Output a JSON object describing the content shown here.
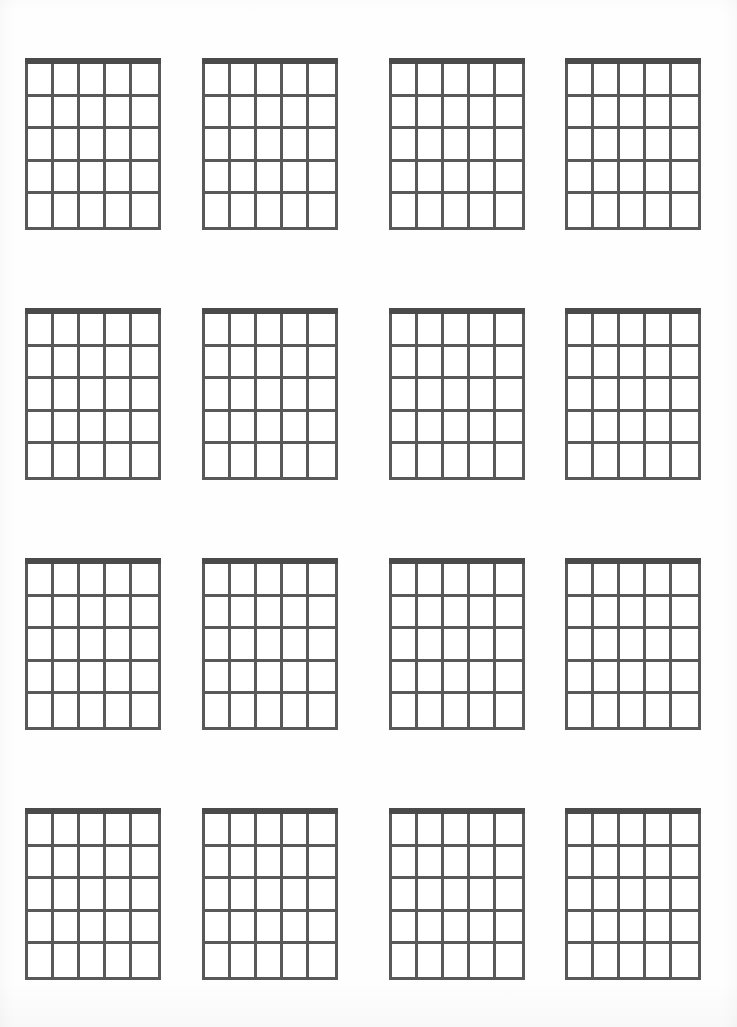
{
  "document": {
    "title": "Blank Guitar Chord Chart Sheet",
    "type": "blank-chord-diagram-worksheet",
    "background_color": "#ffffff",
    "page_width": 737,
    "page_height": 1027
  },
  "diagram_style": {
    "nut_color": "#4a4a4a",
    "grid_line_color": "#595959",
    "cell_fill_color": "#ffffff",
    "nut_thickness_px": 7,
    "grid_line_thickness_px": 3
  },
  "layout": {
    "rows": 4,
    "columns": 4,
    "total_diagrams": 16,
    "diagram_width_px": 136,
    "diagram_height_px": 172,
    "column_left_offsets_px": [
      25,
      202,
      389,
      565
    ],
    "row_top_offsets_px": [
      58,
      308,
      558,
      808
    ]
  },
  "chord_diagram_template": {
    "strings": 6,
    "string_columns": 5,
    "frets": 5,
    "has_nut": true,
    "labels": [],
    "fingering_dots": [],
    "open_string_markers": [],
    "muted_string_markers": [],
    "fret_position_label": ""
  },
  "diagrams": [
    {
      "index": 1,
      "row": 1,
      "col": 1,
      "name": "chord-diagram-1",
      "label": ""
    },
    {
      "index": 2,
      "row": 1,
      "col": 2,
      "name": "chord-diagram-2",
      "label": ""
    },
    {
      "index": 3,
      "row": 1,
      "col": 3,
      "name": "chord-diagram-3",
      "label": ""
    },
    {
      "index": 4,
      "row": 1,
      "col": 4,
      "name": "chord-diagram-4",
      "label": ""
    },
    {
      "index": 5,
      "row": 2,
      "col": 1,
      "name": "chord-diagram-5",
      "label": ""
    },
    {
      "index": 6,
      "row": 2,
      "col": 2,
      "name": "chord-diagram-6",
      "label": ""
    },
    {
      "index": 7,
      "row": 2,
      "col": 3,
      "name": "chord-diagram-7",
      "label": ""
    },
    {
      "index": 8,
      "row": 2,
      "col": 4,
      "name": "chord-diagram-8",
      "label": ""
    },
    {
      "index": 9,
      "row": 3,
      "col": 1,
      "name": "chord-diagram-9",
      "label": ""
    },
    {
      "index": 10,
      "row": 3,
      "col": 2,
      "name": "chord-diagram-10",
      "label": ""
    },
    {
      "index": 11,
      "row": 3,
      "col": 3,
      "name": "chord-diagram-11",
      "label": ""
    },
    {
      "index": 12,
      "row": 3,
      "col": 4,
      "name": "chord-diagram-12",
      "label": ""
    },
    {
      "index": 13,
      "row": 4,
      "col": 1,
      "name": "chord-diagram-13",
      "label": ""
    },
    {
      "index": 14,
      "row": 4,
      "col": 2,
      "name": "chord-diagram-14",
      "label": ""
    },
    {
      "index": 15,
      "row": 4,
      "col": 3,
      "name": "chord-diagram-15",
      "label": ""
    },
    {
      "index": 16,
      "row": 4,
      "col": 4,
      "name": "chord-diagram-16",
      "label": ""
    }
  ]
}
